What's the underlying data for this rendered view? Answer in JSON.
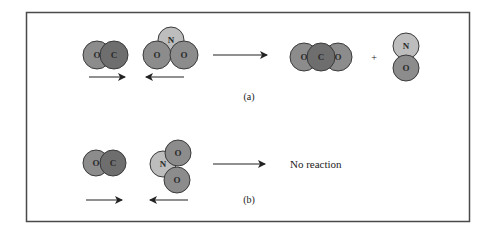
{
  "colors": {
    "oxygen": "#8c8c8c",
    "carbon": "#6e6e6e",
    "nitrogen": "#bdbdbd",
    "outline": "#3a3a3a",
    "frame": "#4a4a4a",
    "arrow": "#222222"
  },
  "panel_a": {
    "caption": "(a)",
    "reactant_1": {
      "name": "CO",
      "atoms": [
        "O",
        "C"
      ]
    },
    "reactant_2": {
      "name": "NO2",
      "atoms": [
        "N",
        "O",
        "O"
      ]
    },
    "plus": "+",
    "product_1": {
      "name": "CO2",
      "atoms": [
        "O",
        "C",
        "O"
      ]
    },
    "product_2": {
      "name": "NO",
      "atoms": [
        "N",
        "O"
      ]
    }
  },
  "panel_b": {
    "caption": "(b)",
    "reactant_1": {
      "name": "CO",
      "atoms": [
        "O",
        "C"
      ]
    },
    "reactant_2": {
      "name": "NO2",
      "atoms": [
        "N",
        "O",
        "O"
      ]
    },
    "result": "No reaction"
  }
}
